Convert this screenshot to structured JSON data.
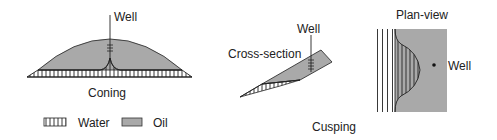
{
  "coning": {
    "title": "Coning",
    "well_label": "Well"
  },
  "cusping": {
    "title": "Cusping",
    "cross_section": {
      "label": "Cross-section",
      "well_label": "Well"
    },
    "plan_view": {
      "label": "Plan-view",
      "well_label": "Well"
    }
  },
  "legend": {
    "water_label": "Water",
    "oil_label": "Oil"
  },
  "colors": {
    "oil_fill": "#a9a9a9",
    "line": "#222222",
    "background": "#ffffff"
  }
}
